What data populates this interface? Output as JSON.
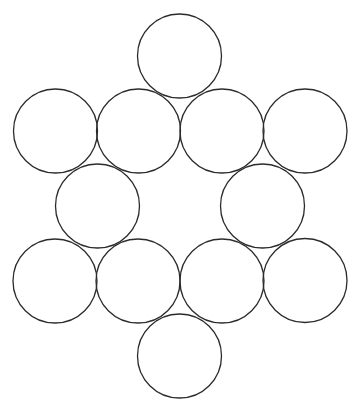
{
  "diagram": {
    "type": "circle-arrangement",
    "width": 360,
    "height": 414,
    "background": "#ffffff",
    "stroke_color": "#2b2b2b",
    "stroke_width": 1.3,
    "fill": "none",
    "radius": 42,
    "circles": [
      {
        "id": "top",
        "cx": 179.5,
        "cy": 56
      },
      {
        "id": "row2-1",
        "cx": 55.5,
        "cy": 131
      },
      {
        "id": "row2-2",
        "cx": 138.5,
        "cy": 131
      },
      {
        "id": "row2-3",
        "cx": 222,
        "cy": 131
      },
      {
        "id": "row2-4",
        "cx": 305,
        "cy": 131
      },
      {
        "id": "row3-left",
        "cx": 97.5,
        "cy": 206
      },
      {
        "id": "row3-right",
        "cx": 262.5,
        "cy": 206
      },
      {
        "id": "row4-1",
        "cx": 55,
        "cy": 281
      },
      {
        "id": "row4-2",
        "cx": 138,
        "cy": 281
      },
      {
        "id": "row4-3",
        "cx": 222,
        "cy": 281
      },
      {
        "id": "row4-4",
        "cx": 305,
        "cy": 280.5
      },
      {
        "id": "bottom",
        "cx": 179.5,
        "cy": 356
      }
    ]
  }
}
